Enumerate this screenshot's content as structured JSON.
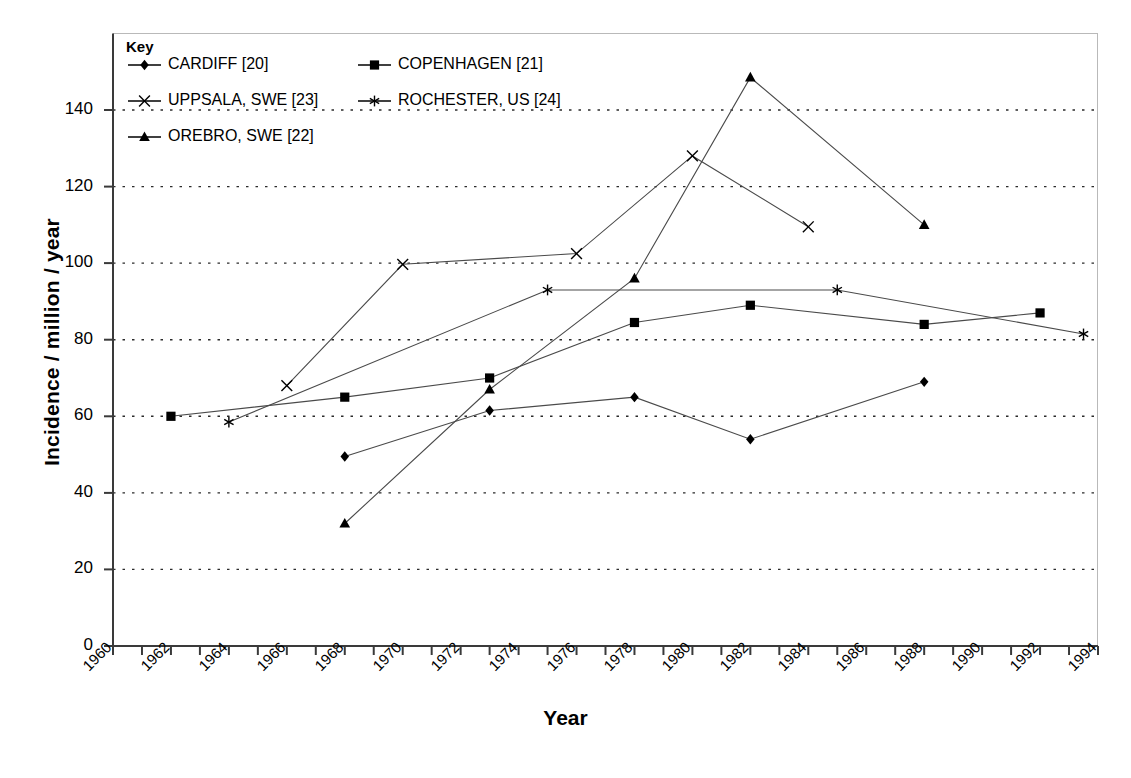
{
  "chart_data": {
    "type": "line",
    "title": "",
    "xlabel": "Year",
    "ylabel": "Incidence / million / year",
    "xlim": [
      1960,
      1994
    ],
    "ylim": [
      0,
      140
    ],
    "ytick_labels": [
      "0",
      "20",
      "40",
      "60",
      "80",
      "100",
      "120",
      "140"
    ],
    "ytick_values": [
      0,
      20,
      40,
      60,
      80,
      100,
      120,
      140
    ],
    "xtick_labels": [
      "1960",
      "1962",
      "1964",
      "1966",
      "1968",
      "1970",
      "1972",
      "1974",
      "1976",
      "1978",
      "1980",
      "1982",
      "1984",
      "1986",
      "1988",
      "1990",
      "1992",
      "1994"
    ],
    "xtick_values": [
      1960,
      1962,
      1964,
      1966,
      1968,
      1970,
      1972,
      1974,
      1976,
      1978,
      1980,
      1982,
      1984,
      1986,
      1988,
      1990,
      1992,
      1994
    ],
    "minor_xticks_every": 1,
    "grid": "horizontal-dotted",
    "legend_position": "top-left-inside",
    "legend_title": "Key",
    "series": [
      {
        "name": "CARDIFF [20]",
        "marker": "diamond",
        "x": [
          1968,
          1973,
          1978,
          1982,
          1988
        ],
        "y": [
          49.5,
          61.5,
          65,
          54,
          69
        ]
      },
      {
        "name": "COPENHAGEN [21]",
        "marker": "square",
        "x": [
          1962,
          1968,
          1973,
          1978,
          1982,
          1988,
          1992
        ],
        "y": [
          60,
          65,
          70,
          84.5,
          89,
          84,
          87
        ]
      },
      {
        "name": "UPPSALA, SWE [23]",
        "marker": "cross-x",
        "x": [
          1966,
          1970,
          1976,
          1980,
          1984
        ],
        "y": [
          68,
          99.7,
          102.5,
          128,
          109.5
        ]
      },
      {
        "name": "ROCHESTER, US [24]",
        "marker": "asterisk",
        "x": [
          1964,
          1975,
          1985,
          1993.5
        ],
        "y": [
          58.5,
          93,
          93,
          81.5
        ]
      },
      {
        "name": "OREBRO, SWE [22]",
        "marker": "triangle",
        "x": [
          1968,
          1973,
          1978,
          1982,
          1988
        ],
        "y": [
          32,
          67,
          96,
          148.5,
          110
        ]
      }
    ]
  },
  "legend": {
    "title": "Key",
    "entries": [
      {
        "label": "CARDIFF [20]",
        "marker": "diamond"
      },
      {
        "label": "COPENHAGEN [21]",
        "marker": "square"
      },
      {
        "label": "UPPSALA, SWE [23]",
        "marker": "cross-x"
      },
      {
        "label": "ROCHESTER, US [24]",
        "marker": "asterisk"
      },
      {
        "label": "OREBRO, SWE [22]",
        "marker": "triangle"
      }
    ]
  },
  "axes": {
    "y_title": "Incidence / million / year",
    "x_title": "Year"
  },
  "caption": ""
}
